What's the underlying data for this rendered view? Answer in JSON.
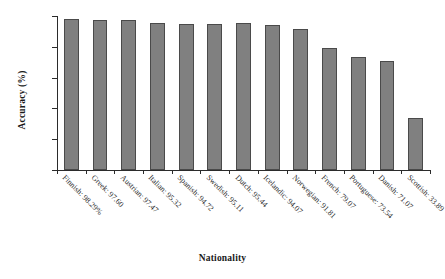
{
  "chart_data": {
    "type": "bar",
    "title": "",
    "xlabel": "Nationality",
    "ylabel": "Accuracy (%)",
    "ylim": [
      0,
      100
    ],
    "yticks": [
      0,
      20,
      40,
      60,
      80,
      100
    ],
    "grid": false,
    "legend": null,
    "bar_color": "#808080",
    "bar_edge_color": "#4a4a4a",
    "categories": [
      "Finnish",
      "Greek",
      "Austrian",
      "Italian",
      "Spanish",
      "Swedish",
      "Dutch",
      "Icelandic",
      "Norwegian",
      "French",
      "Portuguese",
      "Danish",
      "Scottish"
    ],
    "values": [
      98.29,
      97.6,
      97.47,
      95.32,
      94.72,
      95.11,
      95.44,
      94.07,
      91.81,
      79.07,
      73.54,
      71.07,
      33.89
    ],
    "tick_labels": [
      "Finnish: 98.29%",
      "Greek: 97.60",
      "Austrian: 97.47",
      "Italian: 95.32",
      "Spanish: 94.72",
      "Swedish: 95.11",
      "Dutch: 95.44",
      "Icelandic: 94.07",
      "Norwegian: 91.81",
      "French: 79.07",
      "Portuguese: 73.54",
      "Danish: 71.07",
      "Scottish: 33.89"
    ]
  }
}
